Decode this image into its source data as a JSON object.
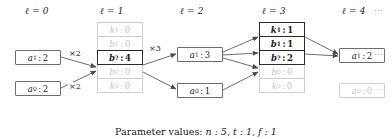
{
  "figure": {
    "caption_prefix": "Parameter values:",
    "caption_params": "n : 5, t : 1, f : 1",
    "ellipsis": "⋯"
  },
  "colors": {
    "node_border": "#6d6d6d",
    "node_border_active": "#2b2b2b",
    "node_dim": "#c2c2c2",
    "edge": "#4a4a4a",
    "text": "#1a1a1a"
  },
  "columns": [
    {
      "id": "level-0",
      "header_symbol": "ℓ",
      "header_value": "0"
    },
    {
      "id": "level-1",
      "header_symbol": "ℓ",
      "header_value": "1"
    },
    {
      "id": "level-2",
      "header_symbol": "ℓ",
      "header_value": "2"
    },
    {
      "id": "level-3",
      "header_symbol": "ℓ",
      "header_value": "3"
    },
    {
      "id": "level-4",
      "header_symbol": "ℓ",
      "header_value": "4"
    }
  ],
  "nodes": {
    "l0_a1": {
      "symbol": "a",
      "sub": "1",
      "value": "2",
      "state": "active"
    },
    "l0_a0": {
      "symbol": "a",
      "sub": "0",
      "value": "2",
      "state": "active"
    },
    "l1_k1": {
      "symbol": "k",
      "sub": "1",
      "value": "0",
      "state": "inactive"
    },
    "l1_b1": {
      "symbol": "b",
      "sub": "1",
      "value": "0",
      "state": "inactive"
    },
    "l1_bq": {
      "symbol": "b",
      "sub": "?",
      "value": "4",
      "state": "selected"
    },
    "l1_b0": {
      "symbol": "b",
      "sub": "0",
      "value": "0",
      "state": "inactive"
    },
    "l1_k0": {
      "symbol": "k",
      "sub": "0",
      "value": "0",
      "state": "inactive"
    },
    "l2_a1": {
      "symbol": "a",
      "sub": "1",
      "value": "3",
      "state": "active"
    },
    "l2_a0": {
      "symbol": "a",
      "sub": "0",
      "value": "1",
      "state": "active"
    },
    "l3_k1": {
      "symbol": "k",
      "sub": "1",
      "value": "1",
      "state": "selected"
    },
    "l3_b1": {
      "symbol": "b",
      "sub": "1",
      "value": "1",
      "state": "selected"
    },
    "l3_bq": {
      "symbol": "b",
      "sub": "?",
      "value": "2",
      "state": "selected"
    },
    "l3_b0": {
      "symbol": "b",
      "sub": "0",
      "value": "0",
      "state": "inactive"
    },
    "l3_k0": {
      "symbol": "k",
      "sub": "0",
      "value": "0",
      "state": "inactive"
    },
    "l4_a1": {
      "symbol": "a",
      "sub": "1",
      "value": "2",
      "state": "active"
    },
    "l4_a0": {
      "symbol": "a",
      "sub": "0",
      "value": "0",
      "state": "inactive"
    }
  },
  "edge_labels": {
    "e_a1_to_bq": "×2",
    "e_a0_to_bq": "×2",
    "e_bq_to_a1": "×3"
  }
}
